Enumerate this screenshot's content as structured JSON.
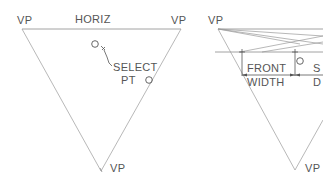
{
  "left_panel": {
    "vp_top_left": "VP",
    "horizon_label": "HORIZ",
    "vp_top_right": "VP",
    "prompt_line1": "SELECT",
    "prompt_line2": "PT",
    "vp_bottom": "VP"
  },
  "right_panel": {
    "vp_top_left": "VP",
    "front_label": "FRONT",
    "width_label": "WIDTH",
    "side_label_partial": "S",
    "depth_label_partial": "D",
    "vp_bottom_partial": "VP"
  },
  "colors": {
    "line": "#8a8a8a",
    "text": "#555555",
    "background": "#ffffff"
  }
}
